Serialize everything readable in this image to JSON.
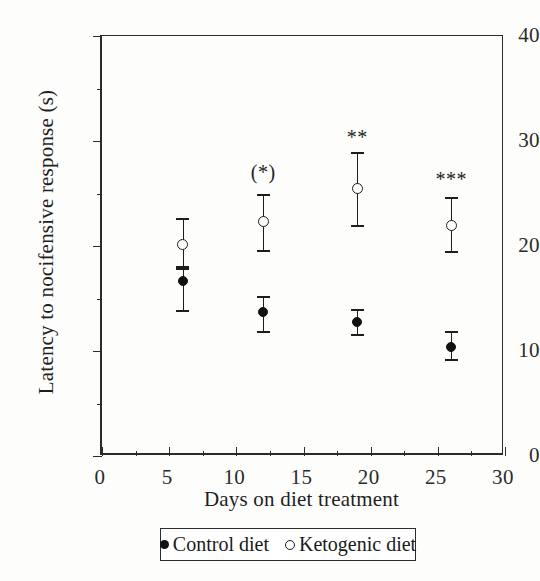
{
  "chart_data": {
    "type": "scatter",
    "title": "",
    "xlabel": "Days on diet treatment",
    "ylabel": "Latency to nocifensive response (s)",
    "xlim": [
      0,
      30
    ],
    "ylim": [
      0,
      40
    ],
    "xticks": [
      0,
      5,
      10,
      15,
      20,
      25,
      30
    ],
    "xtick_labels": [
      "0",
      "5",
      "10",
      "15",
      "20",
      "25",
      "30"
    ],
    "yticks": [
      0,
      10,
      20,
      30,
      40
    ],
    "ytick_labels": [
      "0",
      "10",
      "20",
      "30",
      "40"
    ],
    "x_minor_ticks": [
      2.5,
      7.5,
      12.5,
      17.5,
      22.5,
      27.5
    ],
    "y_minor_ticks": [
      5,
      15,
      25,
      35
    ],
    "grid": false,
    "legend_position": "below-axes",
    "x": [
      6,
      12,
      19,
      26
    ],
    "series": [
      {
        "name": "Control diet",
        "marker": "filled-circle",
        "values": [
          16.7,
          13.7,
          12.8,
          10.4
        ],
        "err_low": [
          2.8,
          1.8,
          1.2,
          1.2
        ],
        "err_high": [
          1.2,
          1.5,
          1.2,
          1.5
        ]
      },
      {
        "name": "Ketogenic diet",
        "marker": "open-circle",
        "values": [
          20.1,
          22.3,
          25.5,
          22.0
        ],
        "err_low": [
          2.0,
          2.7,
          3.5,
          2.5
        ],
        "err_high": [
          2.6,
          2.7,
          3.5,
          2.7
        ]
      }
    ],
    "annotations": [
      {
        "text": "(*)",
        "x": 12,
        "y": 28.0
      },
      {
        "text": "**",
        "x": 19,
        "y": 31.3
      },
      {
        "text": "***",
        "x": 26,
        "y": 27.3
      }
    ]
  },
  "legend": {
    "entries": [
      {
        "label": "Control diet",
        "marker": "filled-circle"
      },
      {
        "label": "Ketogenic diet",
        "marker": "open-circle"
      }
    ]
  }
}
